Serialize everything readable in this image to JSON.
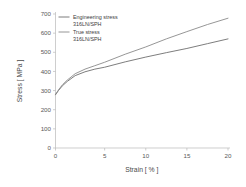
{
  "chart_data": {
    "type": "line",
    "title": "",
    "xlabel": "Strain [ % ]",
    "ylabel": "Stress [ MPa ]",
    "xlim": [
      0,
      20
    ],
    "ylim": [
      0,
      700
    ],
    "x_ticks": [
      0,
      5,
      10,
      15,
      20
    ],
    "x_tick_labels": [
      "0",
      "5",
      "10",
      "15",
      "20"
    ],
    "y_ticks": [
      0,
      100,
      200,
      300,
      400,
      500,
      600,
      700
    ],
    "y_tick_labels": [
      "0",
      "100",
      "200",
      "300",
      "400",
      "500",
      "600",
      "700"
    ],
    "grid": false,
    "legend_position": "top-left",
    "background_color": "#ffffff",
    "axis_color": "#b9b9b9",
    "series": [
      {
        "name": "Engineering stress",
        "subtitle": "316LN/SPH",
        "color": "#6e6e6e",
        "line_width": 0.9,
        "x": [
          0,
          0.3,
          0.7,
          1.2,
          2.0,
          3.0,
          4.0,
          5.0,
          7.5,
          10.0,
          12.5,
          15.0,
          17.5,
          20.0
        ],
        "values": [
          278,
          300,
          325,
          348,
          378,
          398,
          412,
          422,
          450,
          475,
          498,
          520,
          545,
          570
        ]
      },
      {
        "name": "True stress",
        "subtitle": "316LN/SPH",
        "color": "#8a8a8a",
        "line_width": 0.9,
        "x": [
          0,
          0.3,
          0.7,
          1.2,
          2.0,
          3.0,
          4.0,
          5.0,
          7.5,
          10.0,
          12.5,
          15.0,
          17.5,
          20.0
        ],
        "values": [
          280,
          303,
          330,
          355,
          388,
          412,
          430,
          448,
          490,
          528,
          570,
          608,
          645,
          678
        ]
      }
    ]
  },
  "legend": {
    "entries": [
      {
        "label": "Engineering stress",
        "sublabel": "316LN/SPH"
      },
      {
        "label": "True stress",
        "sublabel": "316LN/SPH"
      }
    ]
  }
}
